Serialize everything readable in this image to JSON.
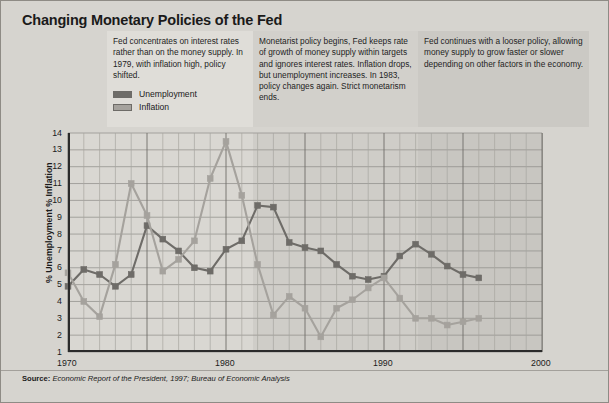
{
  "title": "Changing Monetary Policies of the Fed",
  "annotations": [
    {
      "id": "era-1",
      "text": "Fed concentrates on interest rates rather than on the money supply. In 1979, with inflation high, policy shifted."
    },
    {
      "id": "era-2",
      "text": "Monetarist policy begins, Fed keeps rate of growth of money supply within targets and ignores interest rates. Inflation drops, but unemployment increases. In 1983, policy changes again. Strict monetarism ends."
    },
    {
      "id": "era-3",
      "text": "Fed continues with a looser policy, allowing money supply to grow faster or slower depending on other factors in the economy."
    }
  ],
  "legend": {
    "position": "upper-left",
    "items": [
      {
        "label": "Unemployment",
        "color": "#6e6c68"
      },
      {
        "label": "Inflation",
        "color": "#a5a29d"
      }
    ]
  },
  "source": {
    "prefix": "Source:",
    "text": "Economic Report of the President, 1997; Bureau of Economic Analysis"
  },
  "chart_data": {
    "type": "line",
    "title": "Changing Monetary Policies of the Fed",
    "xlabel": "",
    "ylabel": "% Unemployment % Inflation",
    "xlim": [
      1970,
      2000
    ],
    "ylim": [
      1,
      14
    ],
    "xticks": [
      1970,
      1980,
      1990,
      2000
    ],
    "yticks": [
      1,
      2,
      3,
      4,
      5,
      6,
      7,
      8,
      9,
      10,
      11,
      12,
      13,
      14
    ],
    "grid": true,
    "x": [
      1970,
      1971,
      1972,
      1973,
      1974,
      1975,
      1976,
      1977,
      1978,
      1979,
      1980,
      1981,
      1982,
      1983,
      1984,
      1985,
      1986,
      1987,
      1988,
      1989,
      1990,
      1991,
      1992,
      1993,
      1994,
      1995,
      1996
    ],
    "series": [
      {
        "name": "Unemployment",
        "color": "#6e6c68",
        "values": [
          4.9,
          5.9,
          5.6,
          4.9,
          5.6,
          8.5,
          7.7,
          7.0,
          6.0,
          5.8,
          7.1,
          7.6,
          9.7,
          9.6,
          7.5,
          7.2,
          7.0,
          6.2,
          5.5,
          5.3,
          5.5,
          6.7,
          7.4,
          6.8,
          6.1,
          5.6,
          5.4
        ],
        "marker": "square"
      },
      {
        "name": "Inflation",
        "color": "#a5a29d",
        "values": [
          5.7,
          4.0,
          3.1,
          6.2,
          11.0,
          9.1,
          5.8,
          6.5,
          7.6,
          11.3,
          13.5,
          10.3,
          6.2,
          3.2,
          4.3,
          3.6,
          1.9,
          3.6,
          4.1,
          4.8,
          5.4,
          4.2,
          3.0,
          3.0,
          2.6,
          2.8,
          3.0
        ],
        "marker": "square"
      }
    ],
    "era_bands": [
      {
        "label": "era-1",
        "x_start": 1970,
        "x_end": 1979
      },
      {
        "label": "era-2",
        "x_start": 1979,
        "x_end": 1983
      },
      {
        "label": "era-3",
        "x_start": 1983,
        "x_end": 2000
      }
    ]
  }
}
